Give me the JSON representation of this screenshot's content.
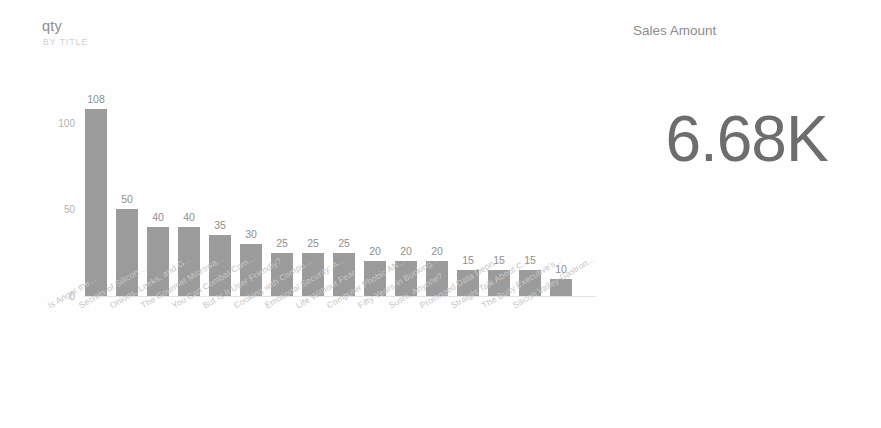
{
  "chart_data": {
    "type": "bar",
    "title": "qty",
    "subtitle": "BY TITLE",
    "xlabel": "",
    "ylabel": "",
    "ylim": [
      0,
      120
    ],
    "yticks": [
      0,
      50,
      100
    ],
    "grid": false,
    "legend": false,
    "orientation": "vertical",
    "bar_color": "#9b9b9b",
    "categories": [
      "Is Anger the...",
      "Secrets of Silicon ...",
      "Onions, Leeks, and G...",
      "The Gourmet Microwa...",
      "You Can Combat Com...",
      "But Is It User Friendly?",
      "Cooking with Compu...",
      "Emotional Security: A...",
      "Life Without Fear",
      "Computer Phobic AN...",
      "Fifty Years in Bucking...",
      "Sushi, Anyone?",
      "Prolonged Data Depri...",
      "Straight Talk About C...",
      "The Busy Executive's...",
      "Silicon Valley Gastron..."
    ],
    "values": [
      108,
      50,
      40,
      40,
      35,
      30,
      25,
      25,
      25,
      20,
      20,
      20,
      15,
      15,
      15,
      10
    ],
    "data_labels": [
      "108",
      "50",
      "40",
      "40",
      "35",
      "30",
      "25",
      "25",
      "25",
      "20",
      "20",
      "20",
      "15",
      "15",
      "15",
      "10"
    ],
    "ytick_labels": [
      "0",
      "50",
      "100"
    ]
  },
  "kpi": {
    "title": "Sales Amount",
    "value": "6.68K"
  }
}
